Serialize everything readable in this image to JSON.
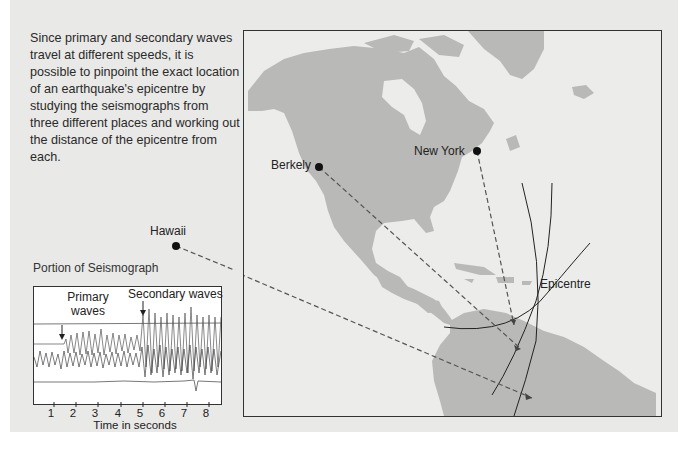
{
  "intro_text": "Since primary and secondary waves travel at different speeds, it is possible to pinpoint the exact location of an earthquake's epicentre by studying the seismographs from three different places and working out the distance of the epicentre from each.",
  "seismograph": {
    "title": "Portion of Seismograph",
    "primary_label_line1": "Primary",
    "primary_label_line2": "waves",
    "secondary_label": "Secondary waves",
    "x_ticks": [
      "1",
      "2",
      "3",
      "4",
      "5",
      "6",
      "7",
      "8"
    ],
    "x_label": "Time in seconds"
  },
  "map": {
    "stations": [
      {
        "name": "Berkely"
      },
      {
        "name": "New York"
      },
      {
        "name": "Hawaii"
      }
    ],
    "epicentre_label": "Epicentre"
  },
  "colors": {
    "panel_bg": "#e9e9e7",
    "land": "#b9b9b7",
    "water": "#ececeb",
    "ink": "#222222"
  }
}
